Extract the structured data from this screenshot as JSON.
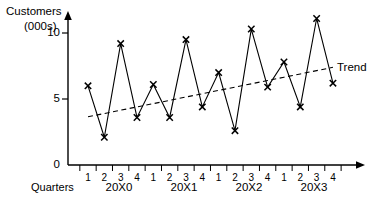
{
  "chart_data": {
    "type": "line",
    "title": "",
    "subtitle": "",
    "ylabel_line1": "Customers",
    "ylabel_line2": "(000s)",
    "xlabel": "Quarters",
    "ylim": [
      0,
      11.6
    ],
    "yticks": [
      "0",
      "5",
      "10"
    ],
    "ytick_values": [
      0,
      5,
      10
    ],
    "grid": false,
    "legend_position": "inline-right",
    "categories": [
      "1",
      "2",
      "3",
      "4",
      "1",
      "2",
      "3",
      "4",
      "1",
      "2",
      "3",
      "4",
      "1",
      "2",
      "3",
      "4"
    ],
    "x_group_labels": [
      "20X0",
      "20X1",
      "20X2",
      "20X3"
    ],
    "series": [
      {
        "name": "Customers",
        "marker": "x",
        "style": "solid",
        "values": [
          6.0,
          2.1,
          9.2,
          3.6,
          6.1,
          3.6,
          9.5,
          4.4,
          7.0,
          2.6,
          10.3,
          5.9,
          7.8,
          4.4,
          11.1,
          6.2
        ]
      },
      {
        "name": "Trend",
        "marker": "none",
        "style": "dashed",
        "values": [
          3.65,
          3.9,
          4.15,
          4.4,
          4.65,
          4.9,
          5.15,
          5.4,
          5.65,
          5.9,
          6.15,
          6.4,
          6.65,
          6.9,
          7.15,
          7.4
        ]
      }
    ],
    "annotations": [
      {
        "text": "Trend",
        "x_index": 15,
        "y_value": 7.4
      }
    ],
    "colors": {
      "axis": "#000000",
      "series_line": "#000000",
      "trend_line": "#000000",
      "background": "#ffffff"
    }
  }
}
